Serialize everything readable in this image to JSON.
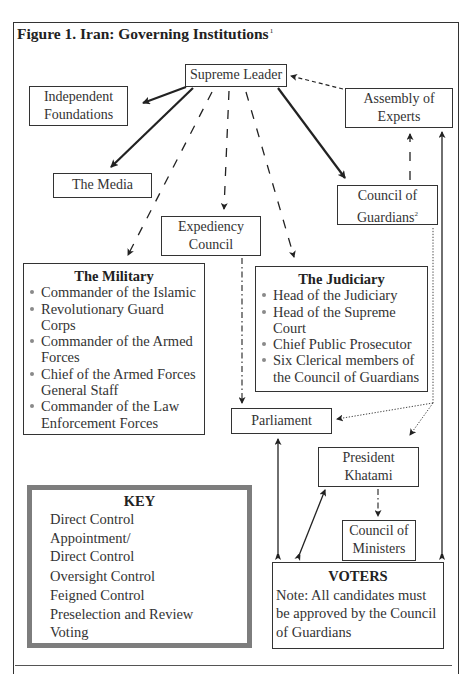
{
  "figure": {
    "title": "Figure 1. Iran: Governing Institutions",
    "title_footnote": "1"
  },
  "nodes": {
    "supreme_leader": "Supreme Leader",
    "independent_foundations": [
      "Independent",
      "Foundations"
    ],
    "assembly_of_experts": [
      "Assembly of",
      "Experts"
    ],
    "the_media": "The Media",
    "expediency_council": [
      "Expediency",
      "Council"
    ],
    "council_of_guardians": [
      "Council of",
      "Guardians"
    ],
    "council_of_guardians_footnote": "2",
    "parliament": "Parliament",
    "president": [
      "President",
      "Khatami"
    ],
    "council_of_ministers": [
      "Council of",
      "Ministers"
    ]
  },
  "military": {
    "header": "The Military",
    "items": [
      "Commander of the Islamic",
      "Revolutionary Guard Corps",
      "Commander of the Armed Forces",
      "Chief of the Armed Forces General Staff",
      "Commander of the Law Enforcement Forces"
    ]
  },
  "judiciary": {
    "header": "The Judiciary",
    "items": [
      "Head of the Judiciary",
      "Head of the Supreme Court",
      "Chief Public Prosecutor",
      "Six Clerical members of the Council of Guardians"
    ]
  },
  "voters": {
    "header": "VOTERS",
    "note": "Note: All candidates must be approved by the Council of Guardians"
  },
  "key": {
    "header": "KEY",
    "entries": [
      {
        "label": "Direct Control",
        "style": "solid-thick"
      },
      {
        "label": "Appointment/ Direct Control",
        "label_lines": [
          "Appointment/",
          "Direct Control"
        ],
        "style": "long-dash"
      },
      {
        "label": "Oversight Control",
        "style": "dash-dot"
      },
      {
        "label": "Feigned Control",
        "style": "short-dash"
      },
      {
        "label": "Preselection and Review",
        "style": "dotted"
      },
      {
        "label": "Voting",
        "style": "solid-fletched"
      }
    ]
  },
  "edges": [
    {
      "from": "Supreme Leader",
      "to": "Independent Foundations",
      "type": "Direct Control"
    },
    {
      "from": "Supreme Leader",
      "to": "The Media",
      "type": "Direct Control"
    },
    {
      "from": "Supreme Leader",
      "to": "Council of Guardians",
      "type": "Direct Control"
    },
    {
      "from": "Supreme Leader",
      "to": "The Military",
      "type": "Appointment/Direct Control"
    },
    {
      "from": "Supreme Leader",
      "to": "Expediency Council",
      "type": "Appointment/Direct Control"
    },
    {
      "from": "Supreme Leader",
      "to": "The Judiciary",
      "type": "Appointment/Direct Control"
    },
    {
      "from": "Assembly of Experts",
      "to": "Supreme Leader",
      "type": "Feigned Control"
    },
    {
      "from": "Council of Guardians",
      "to": "Assembly of Experts",
      "type": "Appointment/Direct Control"
    },
    {
      "from": "Council of Guardians",
      "to": "Parliament",
      "type": "Preselection and Review"
    },
    {
      "from": "Council of Guardians",
      "to": "President Khatami",
      "type": "Preselection and Review"
    },
    {
      "from": "Expediency Council",
      "to": "Parliament",
      "type": "Oversight Control"
    },
    {
      "from": "President Khatami",
      "to": "Council of Ministers",
      "type": "Oversight Control"
    },
    {
      "from": "Voters",
      "to": "Parliament",
      "type": "Voting"
    },
    {
      "from": "Voters",
      "to": "President Khatami",
      "type": "Voting"
    },
    {
      "from": "Voters",
      "to": "Assembly of Experts",
      "type": "Voting"
    }
  ],
  "colors": {
    "line": "#222222",
    "key_border": "#7d7d7d",
    "bullet": "#8a8a8a"
  }
}
